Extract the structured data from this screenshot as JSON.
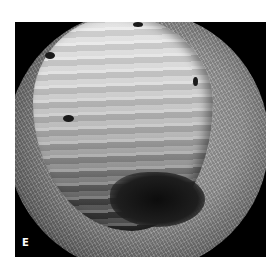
{
  "figure": {
    "panel_label": "E"
  }
}
